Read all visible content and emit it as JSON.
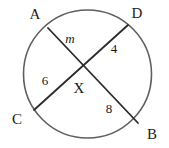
{
  "figure": {
    "kind": "circle-with-intersecting-chords",
    "width": 169,
    "height": 148,
    "background_color": "#ffffff",
    "circle_stroke_color": "#5f5f5f",
    "chord_stroke_color": "#2b2b2b",
    "text_color": "#1a1a1a"
  },
  "circle": {
    "center_x": 87.5,
    "center_y": 74,
    "radius": 64,
    "stroke_width": 1.6
  },
  "points": {
    "A": {
      "label": "A",
      "label_x": 35,
      "label_y": 14,
      "on_circle_x": 48,
      "on_circle_y": 28
    },
    "D": {
      "label": "D",
      "label_x": 137,
      "label_y": 13,
      "on_circle_x": 128,
      "on_circle_y": 25
    },
    "C": {
      "label": "C",
      "label_x": 17,
      "label_y": 119,
      "on_circle_x": 34,
      "on_circle_y": 110
    },
    "B": {
      "label": "B",
      "label_x": 152,
      "label_y": 134,
      "on_circle_x": 138,
      "on_circle_y": 123
    },
    "X": {
      "label": "X",
      "label_x": 79,
      "label_y": 88,
      "intersect_x": 78,
      "intersect_y": 66
    }
  },
  "chords": [
    {
      "name": "chord-A-B",
      "from": "A",
      "to": "B"
    },
    {
      "name": "chord-D-C",
      "from": "D",
      "to": "C"
    }
  ],
  "segment_labels": [
    {
      "name": "segment-label-m",
      "text": "m",
      "style": "italic",
      "x": 70,
      "y": 38,
      "segment": "A-X"
    },
    {
      "name": "segment-label-4",
      "text": "4",
      "style": "normal",
      "x": 114,
      "y": 48,
      "segment": "D-X"
    },
    {
      "name": "segment-label-6",
      "text": "6",
      "style": "normal",
      "x": 45,
      "y": 80,
      "segment": "X-C"
    },
    {
      "name": "segment-label-8",
      "text": "8",
      "style": "normal",
      "x": 109,
      "y": 108,
      "segment": "X-B"
    }
  ]
}
